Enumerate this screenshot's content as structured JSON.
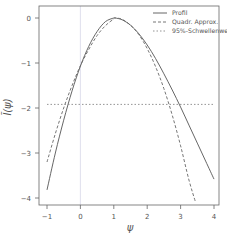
{
  "chart_data": {
    "type": "line",
    "title": "",
    "xlabel": "ψ",
    "ylabel": "l̃(ψ)",
    "xlim": [
      -1.25,
      4.15
    ],
    "ylim": [
      -4.15,
      0.1
    ],
    "x_ticks": [
      -1,
      0,
      1,
      2,
      3,
      4
    ],
    "y_ticks": [
      0,
      -1,
      -2,
      -3,
      -4
    ],
    "grid": false,
    "legend_position": "top-right",
    "vertical_reference_line": {
      "x": 0,
      "color": "#d8d8e8"
    },
    "series": [
      {
        "name": "Profil",
        "style": "solid",
        "color": "#555555",
        "x": [
          -1.0,
          -0.75,
          -0.5,
          -0.25,
          0.0,
          0.25,
          0.5,
          0.75,
          1.0,
          1.05,
          1.25,
          1.5,
          1.75,
          2.0,
          2.25,
          2.5,
          2.75,
          3.0,
          3.25,
          3.5,
          3.75,
          4.0
        ],
        "y": [
          -3.82,
          -3.0,
          -2.27,
          -1.62,
          -1.07,
          -0.63,
          -0.3,
          -0.08,
          0.0,
          0.0,
          -0.04,
          -0.16,
          -0.35,
          -0.6,
          -0.9,
          -1.24,
          -1.6,
          -1.98,
          -2.38,
          -2.78,
          -3.18,
          -3.58
        ]
      },
      {
        "name": "Quadr. Approx.",
        "style": "dashed",
        "color": "#666666",
        "x": [
          -1.0,
          -0.75,
          -0.5,
          -0.25,
          0.0,
          0.25,
          0.5,
          0.75,
          1.0,
          1.05,
          1.25,
          1.5,
          1.75,
          2.0,
          2.25,
          2.5,
          2.75,
          3.0,
          3.25,
          3.45
        ],
        "y": [
          -3.2,
          -2.57,
          -2.0,
          -1.5,
          -1.06,
          -0.7,
          -0.39,
          -0.17,
          -0.02,
          0.0,
          -0.03,
          -0.16,
          -0.37,
          -0.68,
          -1.08,
          -1.57,
          -2.16,
          -2.84,
          -3.6,
          -4.1
        ]
      },
      {
        "name": "95%-Schwellenwert",
        "style": "dotted",
        "color": "#888888",
        "x": [
          -1.0,
          4.0
        ],
        "y": [
          -1.92,
          -1.92
        ]
      }
    ]
  }
}
